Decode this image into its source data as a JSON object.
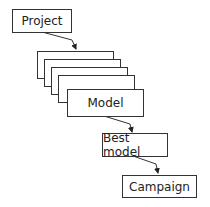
{
  "diagram": {
    "nodes": [
      {
        "id": "project",
        "label": "Project"
      },
      {
        "id": "model",
        "label": "Model",
        "stacked_copies": 4
      },
      {
        "id": "best_model",
        "label": "Best model"
      },
      {
        "id": "campaign",
        "label": "Campaign"
      }
    ],
    "edges": [
      {
        "from": "project",
        "to": "model"
      },
      {
        "from": "model",
        "to": "best_model"
      },
      {
        "from": "best_model",
        "to": "campaign"
      }
    ],
    "stack_hidden_label": "Model"
  }
}
